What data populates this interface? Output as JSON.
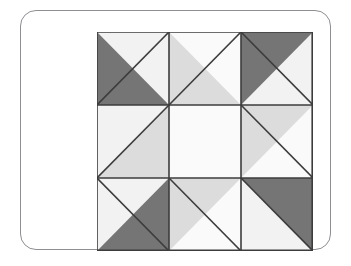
{
  "figure": {
    "kind": "quilt-block-diagram",
    "canvas": {
      "width": 351,
      "height": 266,
      "background": "#ffffff"
    }
  },
  "card": {
    "background": "#ffffff",
    "border_color": "#8e8e93",
    "border_width": 1,
    "corner_radius": 16,
    "x": 20,
    "y": 10,
    "width": 311,
    "height": 240
  },
  "palette": {
    "dark": "#757575",
    "medium": "#dcdcdc",
    "light": "#f2f2f2",
    "white": "#fafafa",
    "outline": "#3c3c3c",
    "outline_width": 1.6
  },
  "grid": {
    "rows": 3,
    "cols": 3,
    "x": 76,
    "y": 21,
    "width": 216,
    "height": 219,
    "cell_width": 72,
    "cell_height": 73
  },
  "cells": [
    {
      "name": "cell-top-left",
      "row": 0,
      "col": 0,
      "split": "anti-diagonal",
      "triangle_a_position": "bottom-left",
      "triangle_a_color": "#757575",
      "triangle_b_position": "top-right",
      "triangle_b_color": "#f2f2f2"
    },
    {
      "name": "cell-top-middle",
      "row": 0,
      "col": 1,
      "split": "anti-diagonal",
      "triangle_a_position": "bottom-left",
      "triangle_a_color": "#dcdcdc",
      "triangle_b_position": "top-right",
      "triangle_b_color": "#fafafa"
    },
    {
      "name": "cell-top-right",
      "row": 0,
      "col": 2,
      "split": "main-diagonal",
      "triangle_a_position": "top-left",
      "triangle_a_color": "#757575",
      "triangle_b_position": "bottom-right",
      "triangle_b_color": "#f2f2f2"
    },
    {
      "name": "cell-middle-left",
      "row": 1,
      "col": 0,
      "split": "anti-diagonal",
      "triangle_a_position": "bottom-right",
      "triangle_a_color": "#dcdcdc",
      "triangle_b_position": "top-left",
      "triangle_b_color": "#f2f2f2"
    },
    {
      "name": "cell-center",
      "row": 1,
      "col": 1,
      "split": "none",
      "triangle_a_position": "full",
      "triangle_a_color": "#fafafa",
      "triangle_b_position": "none",
      "triangle_b_color": "#fafafa"
    },
    {
      "name": "cell-middle-right",
      "row": 1,
      "col": 2,
      "split": "main-diagonal",
      "triangle_a_position": "top-left",
      "triangle_a_color": "#dcdcdc",
      "triangle_b_position": "bottom-right",
      "triangle_b_color": "#fafafa"
    },
    {
      "name": "cell-bottom-left",
      "row": 2,
      "col": 0,
      "split": "main-diagonal",
      "triangle_a_position": "bottom-right",
      "triangle_a_color": "#757575",
      "triangle_b_position": "top-left",
      "triangle_b_color": "#f2f2f2"
    },
    {
      "name": "cell-bottom-middle",
      "row": 2,
      "col": 1,
      "split": "main-diagonal",
      "triangle_a_position": "top-left",
      "triangle_a_color": "#dcdcdc",
      "triangle_b_position": "bottom-right",
      "triangle_b_color": "#fafafa"
    },
    {
      "name": "cell-bottom-right",
      "row": 2,
      "col": 2,
      "split": "main-diagonal",
      "triangle_a_position": "top-right",
      "triangle_a_color": "#757575",
      "triangle_b_position": "bottom-left",
      "triangle_b_color": "#f2f2f2"
    }
  ]
}
